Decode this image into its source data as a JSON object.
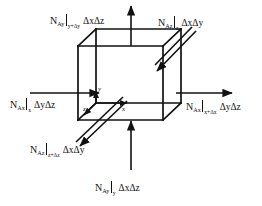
{
  "figure": {
    "background_color": "#ffffff",
    "line_color": "#111111",
    "width": 262,
    "height": 206
  },
  "axes": {
    "y_label": "y",
    "z_label": "z",
    "x_label": "x"
  },
  "flux_labels": {
    "top": {
      "symbol": "N",
      "symbol_sub": "Ay",
      "evaluated_at": "y+Δy",
      "area": "ΔxΔz",
      "direction": "up",
      "full_text": "N_Ay|_(y+Δy) ΔxΔz"
    },
    "top_right": {
      "symbol": "N",
      "symbol_sub": "Az",
      "evaluated_at": "z",
      "area": "ΔxΔy",
      "direction": "into-page-diagonal",
      "full_text": "N_Az|_z ΔxΔy"
    },
    "left": {
      "symbol": "N",
      "symbol_sub": "Ax",
      "evaluated_at": "x",
      "area": "ΔyΔz",
      "direction": "right",
      "full_text": "N_Ax|_x ΔyΔz"
    },
    "right": {
      "symbol": "N",
      "symbol_sub": "Ax",
      "evaluated_at": "x+Δx",
      "area": "ΔyΔz",
      "direction": "right",
      "full_text": "N_Ax|_(x+Δx) ΔyΔz"
    },
    "bottom_left": {
      "symbol": "N",
      "symbol_sub": "Az",
      "evaluated_at": "z+Δz",
      "area": "ΔxΔy",
      "direction": "out-of-page-diagonal",
      "full_text": "N_Az|_(z+Δz) ΔxΔy"
    },
    "bottom": {
      "symbol": "N",
      "symbol_sub": "Ay",
      "evaluated_at": "y",
      "area": "ΔxΔz",
      "direction": "up",
      "full_text": "N_Ay|_y ΔxΔz"
    }
  }
}
